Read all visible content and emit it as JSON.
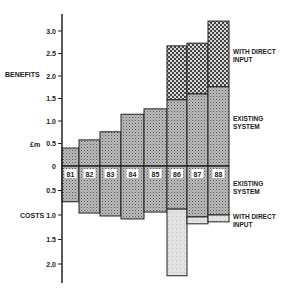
{
  "chart_data": {
    "type": "bar",
    "title": "",
    "ylabel": "£m",
    "ylabel_top": "BENEFITS",
    "ylabel_bottom": "COSTS",
    "categories": [
      "81",
      "82",
      "83",
      "84",
      "85",
      "86",
      "87",
      "88"
    ],
    "benefits": {
      "series": [
        {
          "name": "EXISTING SYSTEM",
          "values": [
            0.4,
            0.58,
            0.76,
            1.15,
            1.27,
            1.47,
            1.6,
            1.76
          ]
        },
        {
          "name": "WITH DIRECT INPUT",
          "values": [
            0.4,
            0.58,
            0.76,
            1.15,
            1.27,
            2.67,
            2.73,
            3.22
          ]
        }
      ],
      "ticks": [
        "0",
        "0.5",
        "1.0",
        "1.5",
        "2.0",
        "2.5",
        "3.0"
      ],
      "ylim": [
        0,
        3.3
      ]
    },
    "costs": {
      "series": [
        {
          "name": "EXISTING SYSTEM",
          "values": [
            0.73,
            0.96,
            1.02,
            1.08,
            0.94,
            0.88,
            1.04,
            1.0
          ]
        },
        {
          "name": "WITH DIRECT INPUT",
          "values": [
            0.73,
            0.96,
            1.02,
            1.08,
            0.94,
            2.24,
            1.18,
            1.14
          ]
        }
      ],
      "ticks": [
        "0.5",
        "1.0",
        "1.5",
        "2.0"
      ],
      "ylim": [
        0,
        2.4
      ]
    },
    "legend": {
      "benefits_direct": [
        "WITH DIRECT",
        "INPUT"
      ],
      "benefits_existing": [
        "EXISTING",
        "SYSTEM"
      ],
      "costs_existing": [
        "EXISTING",
        "SYSTEM"
      ],
      "costs_direct": [
        "WITH DIRECT",
        "INPUT"
      ]
    },
    "grid": false
  }
}
